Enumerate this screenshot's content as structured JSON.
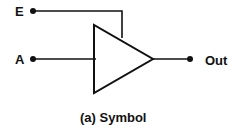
{
  "diagram": {
    "inputs": [
      {
        "label": "E",
        "role": "enable"
      },
      {
        "label": "A",
        "role": "data input"
      }
    ],
    "output": {
      "label": "Out"
    },
    "caption": "(a) Symbol",
    "stroke_color": "#111111"
  }
}
